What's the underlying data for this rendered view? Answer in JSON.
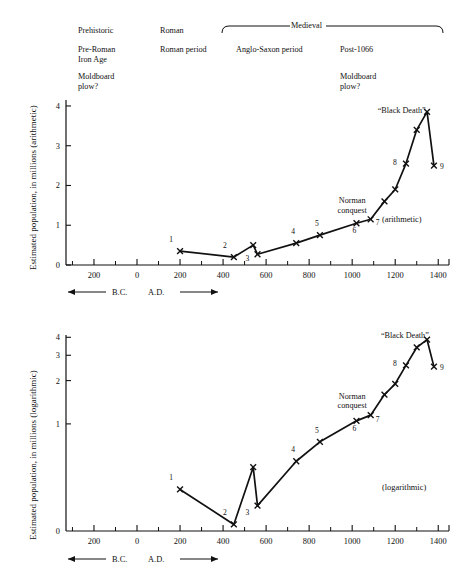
{
  "header": {
    "periods_row1": [
      {
        "label": "Prehistoric",
        "x": 78,
        "y": 26
      },
      {
        "label": "Roman",
        "x": 160,
        "y": 26
      }
    ],
    "medieval_bracket_label": "Medieval",
    "periods_row2": [
      {
        "label": "Pre-Roman\nIron Age",
        "x": 78,
        "y": 45
      },
      {
        "label": "Roman period",
        "x": 160,
        "y": 45
      },
      {
        "label": "Anglo-Saxon period",
        "x": 236,
        "y": 45
      },
      {
        "label": "Post-1066",
        "x": 340,
        "y": 45
      }
    ],
    "periods_row3": [
      {
        "label": "Moldboard\nplow?",
        "x": 78,
        "y": 72
      },
      {
        "label": "Moldboard\nplow?",
        "x": 340,
        "y": 72
      }
    ]
  },
  "axis_note": {
    "bc_label": "B.C.",
    "ad_label": "A.D."
  },
  "chart_data": [
    {
      "type": "line",
      "title": "",
      "scale_note": "(arithmetic)",
      "ylabel": "Estimated population, in millions (arithmetic)",
      "xlabel": "",
      "yscale": "linear",
      "ylim": [
        0,
        4.15
      ],
      "yticks": [
        0,
        1,
        2,
        3,
        4
      ],
      "ytick_labels": [
        "0",
        "1",
        "2",
        "3",
        "4"
      ],
      "xlim": [
        -330,
        1450
      ],
      "xticks": [
        -200,
        0,
        200,
        400,
        600,
        800,
        1000,
        1200,
        1400
      ],
      "xtick_labels": [
        "200",
        "0",
        "200",
        "400",
        "600",
        "800",
        "1000",
        "1200",
        "1400"
      ],
      "xminor": [
        -300,
        -100,
        100,
        300,
        500,
        700,
        900,
        1100,
        1300
      ],
      "grid": false,
      "x": [
        200,
        450,
        540,
        560,
        740,
        850,
        1020,
        1086,
        1150,
        1200,
        1250,
        1300,
        1348,
        1380
      ],
      "y": [
        0.35,
        0.2,
        0.5,
        0.27,
        0.55,
        0.75,
        1.05,
        1.15,
        1.6,
        1.9,
        2.55,
        3.4,
        3.85,
        2.5
      ],
      "point_labels": [
        {
          "n": "1",
          "x": 200,
          "y": 0.35,
          "dx": -9,
          "dy": -9
        },
        {
          "n": "2",
          "x": 450,
          "y": 0.2,
          "dx": -9,
          "dy": -9
        },
        {
          "n": "3",
          "x": 560,
          "y": 0.27,
          "dx": -10,
          "dy": 7
        },
        {
          "n": "4",
          "x": 740,
          "y": 0.55,
          "dx": -3,
          "dy": -9
        },
        {
          "n": "5",
          "x": 850,
          "y": 0.75,
          "dx": -3,
          "dy": -9
        },
        {
          "n": "6",
          "x": 1020,
          "y": 1.05,
          "dx": -2,
          "dy": 10
        },
        {
          "n": "7",
          "x": 1086,
          "y": 1.15,
          "dx": 7,
          "dy": 6
        },
        {
          "n": "8",
          "x": 1250,
          "y": 2.55,
          "dx": -11,
          "dy": 1
        },
        {
          "n": "9",
          "x": 1380,
          "y": 2.5,
          "dx": 8,
          "dy": 3
        }
      ],
      "annotations": [
        {
          "text": "Norman\nconquest",
          "x": 1000,
          "y": 1.55
        },
        {
          "text": "“Black Death”",
          "x": 1230,
          "y": 3.82
        }
      ]
    },
    {
      "type": "line",
      "title": "",
      "scale_note": "(logarithmic)",
      "ylabel": "Estimated population, in millions (logarithmic)",
      "xlabel": "",
      "yscale": "log",
      "ylim": [
        0.18,
        4.15
      ],
      "yticks": [
        1,
        2,
        3,
        4
      ],
      "ytick_labels": [
        "1",
        "2",
        "3",
        "4"
      ],
      "zero_tick_label": "0",
      "xlim": [
        -330,
        1450
      ],
      "xticks": [
        -200,
        0,
        200,
        400,
        600,
        800,
        1000,
        1200,
        1400
      ],
      "xtick_labels": [
        "200",
        "0",
        "200",
        "400",
        "600",
        "800",
        "1000",
        "1200",
        "1400"
      ],
      "xminor": [
        -300,
        -100,
        100,
        300,
        500,
        700,
        900,
        1100,
        1300
      ],
      "grid": false,
      "x": [
        200,
        450,
        540,
        560,
        740,
        850,
        1020,
        1086,
        1150,
        1200,
        1250,
        1300,
        1348,
        1380
      ],
      "y": [
        0.35,
        0.2,
        0.5,
        0.27,
        0.55,
        0.75,
        1.05,
        1.15,
        1.6,
        1.9,
        2.55,
        3.4,
        3.85,
        2.5
      ],
      "point_labels": [
        {
          "n": "1",
          "x": 200,
          "y": 0.35,
          "dx": -9,
          "dy": -9
        },
        {
          "n": "2",
          "x": 450,
          "y": 0.2,
          "dx": -9,
          "dy": -9
        },
        {
          "n": "3",
          "x": 560,
          "y": 0.27,
          "dx": -10,
          "dy": 9
        },
        {
          "n": "4",
          "x": 740,
          "y": 0.55,
          "dx": -3,
          "dy": -9
        },
        {
          "n": "5",
          "x": 850,
          "y": 0.75,
          "dx": -3,
          "dy": -9
        },
        {
          "n": "6",
          "x": 1020,
          "y": 1.05,
          "dx": -2,
          "dy": 10
        },
        {
          "n": "7",
          "x": 1086,
          "y": 1.15,
          "dx": 7,
          "dy": 7
        },
        {
          "n": "8",
          "x": 1250,
          "y": 2.55,
          "dx": -11,
          "dy": 1
        },
        {
          "n": "9",
          "x": 1380,
          "y": 2.5,
          "dx": 8,
          "dy": 3
        }
      ],
      "annotations": [
        {
          "text": "Norman\nconquest",
          "x": 1000,
          "y": 1.5
        },
        {
          "text": "“Black Death”",
          "x": 1245,
          "y": 3.95
        }
      ]
    }
  ]
}
